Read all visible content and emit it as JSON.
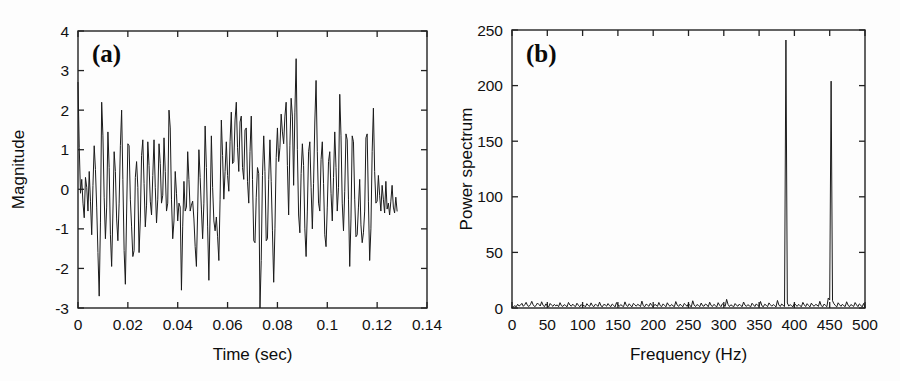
{
  "figure": {
    "background_color": "#fdfdfd",
    "line_color": "#1b1b1b",
    "axis_color": "#222222",
    "width": 900,
    "height": 381
  },
  "panels": [
    {
      "tag": "(a)",
      "name": "time-domain-signal"
    },
    {
      "tag": "(b)",
      "name": "power-spectrum"
    }
  ],
  "chart_data": [
    {
      "type": "line",
      "title": "",
      "panel_label": "(a)",
      "xlabel": "Time (sec)",
      "ylabel": "Magnitude",
      "xlim": [
        0,
        0.14
      ],
      "ylim": [
        -3,
        4
      ],
      "xticks": [
        0,
        0.02,
        0.04,
        0.06,
        0.08,
        0.1,
        0.12,
        0.14
      ],
      "xticklabels": [
        "0",
        "0.02",
        "0.04",
        "0.06",
        "0.08",
        "0.1",
        "0.12",
        "0.14"
      ],
      "yticks": [
        -3,
        -2,
        -1,
        0,
        1,
        2,
        3,
        4
      ],
      "yticklabels": [
        "-3",
        "-2",
        "-1",
        "0",
        "1",
        "2",
        "3",
        "4"
      ],
      "grid": false,
      "legend": null,
      "x_sampling": {
        "start": 0.0,
        "step": 0.0005,
        "count": 257,
        "end": 0.128
      },
      "values": [
        2.7,
        1.05,
        -0.1,
        0.25,
        -0.35,
        -0.72,
        0.3,
        0.05,
        -0.55,
        0.45,
        -0.3,
        -1.15,
        0.1,
        1.1,
        0.5,
        -0.45,
        -1.6,
        -2.7,
        -0.85,
        2.2,
        1.35,
        -0.2,
        -1.25,
        -0.45,
        1.45,
        0.55,
        -1.15,
        -1.95,
        -0.6,
        0.95,
        0.45,
        -0.75,
        -1.3,
        -0.35,
        1.1,
        2.0,
        0.25,
        -1.55,
        -2.4,
        -0.6,
        1.15,
        1.1,
        -0.25,
        -0.95,
        -1.7,
        -1.55,
        0.3,
        0.7,
        0.05,
        -1.6,
        -0.75,
        0.85,
        1.25,
        0.15,
        -0.95,
        -0.4,
        1.2,
        0.6,
        -0.3,
        -0.65,
        0.35,
        1.25,
        0.05,
        -0.85,
        -0.25,
        1.15,
        0.65,
        -0.35,
        -0.15,
        1.3,
        0.45,
        -0.55,
        -0.35,
        2.0,
        1.55,
        -0.25,
        -1.25,
        -0.8,
        0.45,
        -0.1,
        -0.8,
        -0.35,
        -0.45,
        -2.55,
        -0.95,
        0.2,
        -0.55,
        -0.45,
        0.95,
        0.25,
        -0.55,
        -0.4,
        -0.3,
        -0.75,
        -1.45,
        -1.95,
        -0.55,
        1.0,
        0.3,
        -0.5,
        -1.25,
        -0.35,
        1.6,
        0.55,
        -0.95,
        -2.3,
        -0.6,
        1.35,
        0.05,
        -0.8,
        -1.05,
        -0.7,
        -1.2,
        -1.8,
        -0.25,
        1.75,
        0.85,
        -0.25,
        0.45,
        1.2,
        0.35,
        -0.05,
        1.2,
        1.95,
        0.65,
        0.7,
        1.75,
        2.2,
        1.05,
        0.45,
        1.7,
        1.85,
        0.55,
        0.25,
        1.5,
        1.55,
        0.2,
        -0.35,
        0.95,
        1.85,
        0.25,
        -1.3,
        -1.35,
        -0.2,
        0.55,
        0.4,
        -3.0,
        -1.8,
        0.35,
        1.35,
        0.45,
        -1.3,
        -1.25,
        0.25,
        1.25,
        0.2,
        -1.05,
        -2.35,
        -1.0,
        0.8,
        1.55,
        0.7,
        1.05,
        1.9,
        1.45,
        1.15,
        1.85,
        2.2,
        0.6,
        -0.65,
        1.1,
        2.3,
        1.85,
        0.1,
        1.95,
        3.3,
        1.0,
        -0.65,
        -1.1,
        0.4,
        1.15,
        0.6,
        -1.0,
        -1.7,
        -0.55,
        0.95,
        1.2,
        0.05,
        -1.0,
        0.15,
        1.7,
        2.75,
        0.95,
        -0.35,
        -0.55,
        0.75,
        1.2,
        0.15,
        -1.15,
        -1.45,
        -0.45,
        0.7,
        0.95,
        -0.1,
        -0.8,
        0.3,
        1.45,
        0.55,
        -0.55,
        0.05,
        2.4,
        1.35,
        -0.35,
        -1.05,
        -0.05,
        1.4,
        1.25,
        -0.25,
        -1.95,
        -0.75,
        1.35,
        1.2,
        -0.25,
        -1.2,
        -1.15,
        -0.45,
        0.25,
        -0.9,
        -1.35,
        -1.1,
        -0.55,
        1.3,
        1.4,
        -0.3,
        -1.8,
        -1.0,
        0.95,
        2.05,
        0.45,
        -0.35,
        -0.3,
        0.35,
        -0.15,
        -0.55,
        0.1,
        -0.25,
        -0.6,
        0.2,
        -0.5,
        -0.35,
        -0.65,
        -0.3,
        0.1,
        -0.45,
        -0.6,
        -0.2,
        -0.55
      ]
    },
    {
      "type": "line",
      "title": "",
      "panel_label": "(b)",
      "xlabel": "Frequency (Hz)",
      "ylabel": "Power spectrum",
      "xlim": [
        0,
        500
      ],
      "ylim": [
        0,
        250
      ],
      "xticks": [
        0,
        50,
        100,
        150,
        200,
        250,
        300,
        350,
        400,
        450,
        500
      ],
      "xticklabels": [
        "0",
        "50",
        "100",
        "150",
        "200",
        "250",
        "300",
        "350",
        "400",
        "450",
        "500"
      ],
      "yticks": [
        0,
        50,
        100,
        150,
        200,
        250
      ],
      "yticklabels": [
        "0",
        "50",
        "100",
        "150",
        "200",
        "250"
      ],
      "grid": false,
      "legend": null,
      "peaks": [
        {
          "frequency": 320,
          "power": 241
        },
        {
          "frequency": 410,
          "power": 204
        }
      ],
      "noise_floor": {
        "mean": 1.6,
        "max": 9
      },
      "x_sampling": {
        "start": 0,
        "step": 2,
        "count": 251,
        "end": 500
      },
      "values": [
        0.4,
        1.2,
        2.0,
        1.1,
        3.4,
        1.8,
        2.6,
        4.2,
        1.5,
        2.9,
        5.1,
        2.2,
        1.4,
        3.0,
        6.0,
        2.8,
        1.3,
        2.1,
        4.5,
        3.2,
        1.8,
        5.6,
        2.4,
        1.2,
        3.7,
        2.0,
        1.0,
        4.1,
        2.6,
        1.5,
        3.3,
        1.9,
        2.8,
        1.2,
        4.8,
        2.1,
        1.4,
        3.0,
        2.2,
        1.1,
        5.0,
        2.7,
        1.6,
        3.5,
        2.0,
        1.3,
        4.3,
        2.5,
        1.1,
        3.1,
        1.8,
        2.4,
        1.0,
        3.9,
        2.3,
        1.5,
        4.6,
        2.1,
        1.2,
        3.4,
        2.6,
        1.4,
        5.3,
        2.0,
        1.1,
        3.2,
        2.8,
        1.6,
        4.0,
        2.2,
        1.3,
        3.6,
        2.4,
        1.0,
        4.9,
        2.7,
        1.5,
        3.1,
        2.0,
        1.2,
        5.5,
        2.3,
        1.4,
        3.8,
        2.1,
        1.1,
        4.2,
        2.9,
        1.6,
        3.3,
        2.5,
        1.3,
        6.2,
        2.0,
        1.2,
        3.5,
        2.6,
        1.5,
        4.4,
        2.2,
        1.0,
        3.0,
        2.8,
        1.4,
        5.0,
        2.1,
        1.3,
        3.7,
        2.4,
        1.1,
        4.7,
        2.5,
        1.6,
        3.2,
        2.0,
        1.2,
        5.8,
        2.7,
        1.4,
        3.4,
        2.3,
        1.1,
        4.1,
        2.9,
        1.5,
        3.9,
        2.2,
        1.0,
        6.5,
        2.6,
        1.3,
        3.1,
        2.4,
        1.2,
        4.5,
        2.0,
        1.6,
        3.6,
        2.8,
        1.1,
        5.2,
        2.3,
        1.4,
        3.3,
        2.1,
        1.0,
        4.8,
        2.5,
        1.2,
        3.8,
        2.7,
        1.5,
        7.8,
        3.2,
        1.3,
        2.9,
        2.0,
        1.1,
        4.0,
        2.4,
        1.6,
        3.5,
        2.2,
        1.2,
        5.4,
        2.6,
        1.4,
        3.0,
        2.1,
        1.0,
        4.3,
        2.8,
        1.3,
        3.7,
        2.3,
        1.5,
        5.9,
        2.0,
        1.1,
        3.4,
        2.5,
        1.2,
        4.6,
        2.9,
        1.6,
        3.1,
        2.2,
        1.0,
        6.8,
        2.7,
        1.4,
        3.6,
        2.4,
        1.3,
        241.0,
        4.5,
        1.8,
        3.0,
        2.1,
        1.1,
        4.2,
        2.6,
        1.5,
        3.3,
        2.0,
        1.2,
        5.1,
        2.8,
        1.3,
        3.9,
        2.3,
        1.0,
        4.4,
        2.5,
        1.6,
        3.2,
        2.7,
        1.4,
        6.0,
        2.1,
        1.1,
        3.5,
        2.4,
        1.2,
        9.0,
        7.2,
        204.0,
        6.5,
        3.8,
        2.2,
        1.0,
        4.7,
        2.9,
        1.5,
        3.4,
        2.0,
        1.3,
        5.6,
        2.6,
        1.1,
        3.1,
        2.3,
        1.4,
        4.9,
        2.8,
        1.2,
        3.7,
        2.5,
        1.0,
        4.1,
        0.6
      ]
    }
  ]
}
